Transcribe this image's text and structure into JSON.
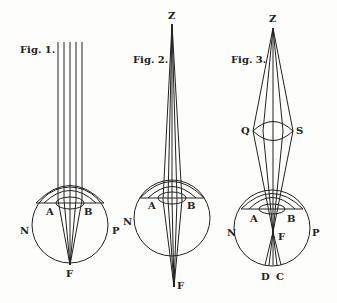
{
  "figures": [
    {
      "id": "fig1",
      "title": "Fig. 1.",
      "description": "Parallel rays entering the eye converge at the retina",
      "labels": {
        "A": "A",
        "B": "B",
        "N": "N",
        "P": "P",
        "F": "F"
      }
    },
    {
      "id": "fig2",
      "title": "Fig. 2.",
      "description": "Diverging rays from near point Z focus behind the retina",
      "labels": {
        "Z": "Z",
        "A": "A",
        "B": "B",
        "N": "N",
        "F": "F"
      }
    },
    {
      "id": "fig3",
      "title": "Fig. 3.",
      "description": "Rays from Z passed through convex lens QS focus in front of retina at F, crossing to D and C",
      "labels": {
        "Z": "Z",
        "Q": "Q",
        "S": "S",
        "A": "A",
        "B": "B",
        "N": "N",
        "P": "P",
        "F": "F",
        "D": "D",
        "C": "C"
      }
    }
  ],
  "colors": {
    "ink": "#222222",
    "paper": "#fdfdfc"
  }
}
